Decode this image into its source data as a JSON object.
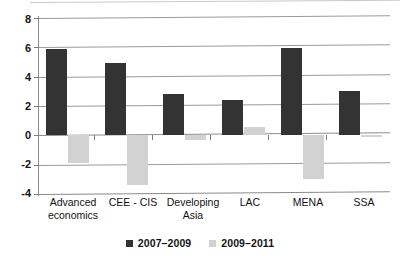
{
  "chart_data": {
    "type": "bar",
    "title": "",
    "subtitle": "",
    "xlabel": "",
    "ylabel": "",
    "categories": [
      "Advanced economics",
      "CEE - CIS",
      "Developing Asia",
      "LAC",
      "MENA",
      "SSA"
    ],
    "series": [
      {
        "name": "2007–2009",
        "color": "#333333",
        "values": [
          5.9,
          4.9,
          2.85,
          2.4,
          5.95,
          3.05
        ]
      },
      {
        "name": "2009–2011",
        "color": "#d2d2d2",
        "values": [
          -1.9,
          -3.4,
          -0.35,
          0.55,
          -2.95,
          -0.1
        ]
      }
    ],
    "ylim": [
      -4,
      8
    ],
    "yticks": [
      8,
      6,
      4,
      2,
      0,
      -2,
      -4
    ],
    "ytick_labels": [
      "8",
      "6",
      "4",
      "2",
      "0",
      "-2",
      "-4"
    ],
    "grid": true,
    "grid_axis": "y",
    "legend_position": "bottom",
    "legend_entries": [
      "2007–2009",
      "2009–2011"
    ]
  },
  "axis": {
    "y_tick_8": "8",
    "y_tick_6": "6",
    "y_tick_4": "4",
    "y_tick_2": "2",
    "y_tick_0": "0",
    "y_tick_m2": "-2",
    "y_tick_m4": "-4"
  },
  "categories": {
    "c0_line1": "Advanced",
    "c0_line2": "economics",
    "c1_line1": "CEE - CIS",
    "c1_line2": "",
    "c2_line1": "Developing",
    "c2_line2": "Asia",
    "c3_line1": "LAC",
    "c3_line2": "",
    "c4_line1": "MENA",
    "c4_line2": "",
    "c5_line1": "SSA",
    "c5_line2": ""
  },
  "legend": {
    "series0_label": "2007–2009",
    "series1_label": "2009–2011"
  },
  "colors": {
    "series0": "#333333",
    "series1": "#d2d2d2",
    "gridline": "#9a9a9a",
    "axis": "#8c8c8c",
    "background": "#ffffff"
  }
}
